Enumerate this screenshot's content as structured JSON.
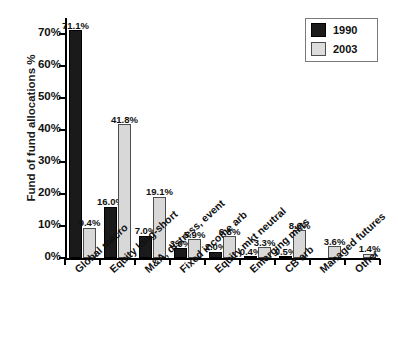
{
  "chart_data": {
    "type": "bar",
    "title": "",
    "xlabel": "",
    "ylabel": "Fund of fund allocations %",
    "ylim": [
      0,
      75
    ],
    "ytick_labels": [
      "0%",
      "10%",
      "20%",
      "30%",
      "40%",
      "50%",
      "60%",
      "70%"
    ],
    "ytick_values": [
      0,
      10,
      20,
      30,
      40,
      50,
      60,
      70
    ],
    "grid": false,
    "legend_position": "top-right",
    "categories": [
      "Global macro",
      "Equity long-short",
      "M&A, distress, event",
      "Fixed income arb",
      "Equity mkt neutral",
      "Emerging mkts",
      "CB arb",
      "Managed futures",
      "Other"
    ],
    "series": [
      {
        "name": "1990",
        "color": "#1a1a1a",
        "values": [
          71.1,
          16.0,
          7.0,
          3.0,
          2.0,
          0.4,
          0.5,
          null,
          null
        ],
        "labels": [
          "71.1%",
          "16.0%",
          "7.0%",
          "3.0%",
          "2.0%",
          "0.4%",
          "0.5%",
          "",
          ""
        ]
      },
      {
        "name": "2003",
        "color": "#d8d8d8",
        "values": [
          9.4,
          41.8,
          19.1,
          5.9,
          6.8,
          3.3,
          8.6,
          3.6,
          1.4
        ],
        "labels": [
          "9.4%",
          "41.8%",
          "19.1%",
          "5.9%",
          "6.8%",
          "3.3%",
          "8.6%",
          "3.6%",
          "1.4%"
        ]
      }
    ]
  },
  "legend": {
    "items": [
      {
        "label": "1990"
      },
      {
        "label": "2003"
      }
    ]
  }
}
